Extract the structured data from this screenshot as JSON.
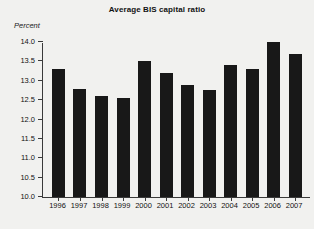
{
  "chart_data": {
    "type": "bar",
    "title": "Average BIS capital ratio",
    "xlabel": "",
    "ylabel": "Percent",
    "categories": [
      "1996",
      "1997",
      "1998",
      "1999",
      "2000",
      "2001",
      "2002",
      "2003",
      "2004",
      "2005",
      "2006",
      "2007"
    ],
    "values": [
      13.3,
      12.8,
      12.6,
      12.55,
      13.5,
      13.2,
      12.9,
      12.75,
      13.4,
      13.3,
      14.0,
      13.7
    ],
    "ylim": [
      10.0,
      14.0
    ],
    "ytick_values": [
      10.0,
      10.5,
      11.0,
      11.5,
      12.0,
      12.5,
      13.0,
      13.5,
      14.0
    ],
    "ytick_labels": [
      "10.0",
      "10.5",
      "11.0",
      "11.5",
      "12.0",
      "12.5",
      "13.0",
      "13.5",
      "14.0"
    ],
    "grid": false,
    "legend": false,
    "bar_color": "#181818",
    "background_color": "#f1f1ef",
    "axis_color": "#3a3a3a"
  }
}
